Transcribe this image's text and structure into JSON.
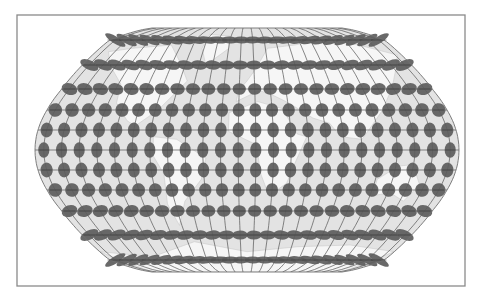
{
  "figure": {
    "title": "Tissot's indicatrix on a pseudocylindrical world projection",
    "width": 492,
    "height": 300
  },
  "frame": {
    "x": 17,
    "y": 15,
    "width": 448,
    "height": 271,
    "stroke": "#8a8a8a",
    "stroke_width": 1.3,
    "fill": "#ffffff"
  },
  "projection": {
    "center_x": 247,
    "center_y": 150,
    "equator_half_width": 212,
    "pole_half_width": 95,
    "top_y": 28,
    "bottom_y": 272,
    "fill": "#e3e3e3",
    "outline_stroke": "#707070",
    "outline_width": 0.9
  },
  "land": {
    "fill": "#f6f6f6",
    "stroke": "#c4c4c4"
  },
  "graticule": {
    "stroke": "#555555",
    "stroke_width": 0.7,
    "meridian_count": 24,
    "parallel_lats": [
      75,
      60,
      45,
      30,
      15,
      0,
      -15,
      -30,
      -45,
      -60,
      -75
    ]
  },
  "tissot": {
    "fill": "#5c5c5c",
    "fill_opacity": 0.92,
    "columns": 24,
    "rows": [
      {
        "lat": 75,
        "y": 40,
        "rx": 8.6,
        "ry": 3.4
      },
      {
        "lat": 60,
        "y": 65,
        "rx": 7.6,
        "ry": 4.6
      },
      {
        "lat": 45,
        "y": 89,
        "rx": 6.6,
        "ry": 5.8
      },
      {
        "lat": 30,
        "y": 110,
        "rx": 6.0,
        "ry": 6.8
      },
      {
        "lat": 15,
        "y": 130,
        "rx": 5.7,
        "ry": 7.4
      },
      {
        "lat": 0,
        "y": 150,
        "rx": 5.6,
        "ry": 7.7
      },
      {
        "lat": -15,
        "y": 170,
        "rx": 5.7,
        "ry": 7.4
      },
      {
        "lat": -30,
        "y": 190,
        "rx": 6.0,
        "ry": 6.8
      },
      {
        "lat": -45,
        "y": 211,
        "rx": 6.6,
        "ry": 5.8
      },
      {
        "lat": -60,
        "y": 235,
        "rx": 7.6,
        "ry": 4.6
      },
      {
        "lat": -75,
        "y": 260,
        "rx": 8.6,
        "ry": 3.4
      }
    ]
  },
  "colors": {
    "background": "#ffffff",
    "ocean": "#e3e3e3",
    "land": "#f6f6f6",
    "ellipse": "#5c5c5c",
    "grid": "#555555",
    "frame": "#8a8a8a"
  }
}
